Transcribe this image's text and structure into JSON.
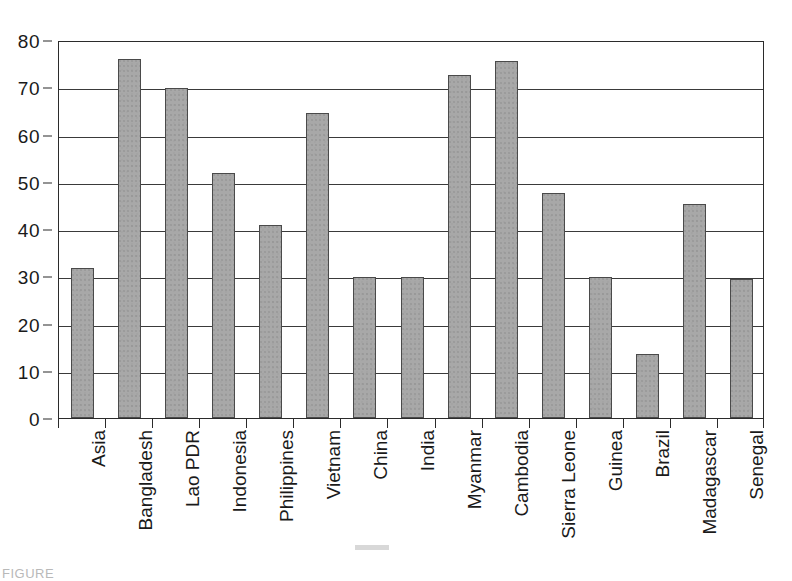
{
  "chart_data": {
    "type": "bar",
    "title": "",
    "subtitle": "",
    "xlabel": "",
    "ylabel": "",
    "ylim": [
      0,
      80
    ],
    "yticks": [
      0,
      10,
      20,
      30,
      40,
      50,
      60,
      70,
      80
    ],
    "ytick_labels": [
      "0",
      "10",
      "20",
      "30",
      "40",
      "50",
      "60",
      "70",
      "80"
    ],
    "grid": true,
    "legend": false,
    "legend_position": "none",
    "bar_color": "#a8a8a8",
    "bar_edge_color": "#4a4a4a",
    "axis_color": "#2b2b2b",
    "categories": [
      "Asia",
      "Bangladesh",
      "Lao PDR",
      "Indonesia",
      "Philippines",
      "Vietnam",
      "China",
      "India",
      "Myanmar",
      "Cambodia",
      "Sierra Leone",
      "Guinea",
      "Brazil",
      "Madagascar",
      "Senegal"
    ],
    "values": [
      31.8,
      76.0,
      69.8,
      51.8,
      40.8,
      64.6,
      29.8,
      29.8,
      72.5,
      75.6,
      47.6,
      29.8,
      13.5,
      45.4,
      29.4
    ],
    "xtick_labels": [
      "Asia",
      "Bangladesh",
      "Lao PDR",
      "Indonesia",
      "Philippines",
      "Vietnam",
      "China",
      "India",
      "Myanmar",
      "Cambodia",
      "Sierra Leone",
      "Guinea",
      "Brazil",
      "Madagascar",
      "Senegal"
    ],
    "annotations": []
  },
  "caption": {
    "text": "FIGURE"
  }
}
